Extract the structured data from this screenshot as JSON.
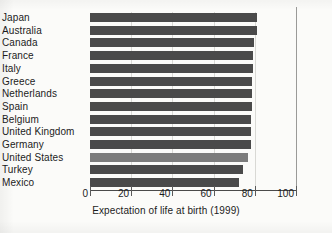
{
  "chart_data": {
    "type": "bar",
    "orientation": "horizontal",
    "title": "",
    "xlabel": "Expectation of life at birth (1999)",
    "ylabel": "",
    "xlim": [
      0,
      100
    ],
    "xticks": [
      0,
      20,
      40,
      60,
      80,
      100
    ],
    "xtick_labels": [
      "0",
      "20",
      "40",
      "60",
      "80",
      "100"
    ],
    "grid": "vertical-faint",
    "legend": "none",
    "categories": [
      "Japan",
      "Australia",
      "Canada",
      "France",
      "Italy",
      "Greece",
      "Netherlands",
      "Spain",
      "Belgium",
      "United Kingdom",
      "Germany",
      "United States",
      "Turkey",
      "Mexico"
    ],
    "values": [
      81.0,
      81.0,
      79.5,
      79.0,
      79.0,
      78.5,
      78.5,
      78.5,
      78.0,
      78.0,
      78.0,
      76.5,
      74.5,
      72.5
    ],
    "bar_color": "#4a4a4a",
    "highlight_color": "#7c7c7c",
    "highlighted_category": "United States"
  },
  "axis": {
    "title": "Expectation of life at birth (1999)"
  }
}
